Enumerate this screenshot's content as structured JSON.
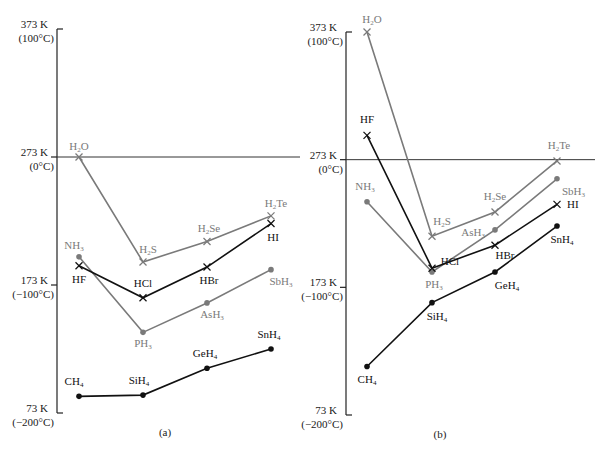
{
  "chart_data": [
    {
      "type": "line",
      "panel_label": "(a)",
      "ylabel": "Temperature",
      "ylim": [
        73,
        373
      ],
      "yticks": [
        {
          "value": 373,
          "k": "373 K",
          "c": "(100°C)"
        },
        {
          "value": 273,
          "k": "273 K",
          "c": "(0°C)"
        },
        {
          "value": 173,
          "k": "173 K",
          "c": "(−100°C)"
        },
        {
          "value": 73,
          "k": "73 K",
          "c": "(−200°C)"
        }
      ],
      "reference_line": 273,
      "x": [
        2,
        3,
        4,
        5
      ],
      "series": [
        {
          "name": "Group 16 hydrides",
          "marker": "x",
          "color": "#7a7a7a",
          "points": [
            {
              "label": "H",
              "sub": "2",
              "tail": "O",
              "value": 273
            },
            {
              "label": "H",
              "sub": "2",
              "tail": "S",
              "value": 191
            },
            {
              "label": "H",
              "sub": "2",
              "tail": "Se",
              "value": 207
            },
            {
              "label": "H",
              "sub": "2",
              "tail": "Te",
              "value": 227
            }
          ]
        },
        {
          "name": "Group 15 hydrides",
          "marker": "dot",
          "color": "#7a7a7a",
          "points": [
            {
              "label": "NH",
              "sub": "3",
              "tail": "",
              "value": 195
            },
            {
              "label": "PH",
              "sub": "3",
              "tail": "",
              "value": 136
            },
            {
              "label": "AsH",
              "sub": "3",
              "tail": "",
              "value": 159
            },
            {
              "label": "SbH",
              "sub": "3",
              "tail": "",
              "value": 185
            }
          ]
        },
        {
          "name": "Group 17 hydrides",
          "marker": "x",
          "color": "#111111",
          "points": [
            {
              "label": "HF",
              "sub": "",
              "tail": "",
              "value": 188
            },
            {
              "label": "HCl",
              "sub": "",
              "tail": "",
              "value": 163
            },
            {
              "label": "HBr",
              "sub": "",
              "tail": "",
              "value": 187
            },
            {
              "label": "HI",
              "sub": "",
              "tail": "",
              "value": 221
            }
          ]
        },
        {
          "name": "Group 14 hydrides",
          "marker": "dot",
          "color": "#111111",
          "points": [
            {
              "label": "CH",
              "sub": "4",
              "tail": "",
              "value": 86
            },
            {
              "label": "SiH",
              "sub": "4",
              "tail": "",
              "value": 87
            },
            {
              "label": "GeH",
              "sub": "4",
              "tail": "",
              "value": 108
            },
            {
              "label": "SnH",
              "sub": "4",
              "tail": "",
              "value": 123
            }
          ]
        }
      ]
    },
    {
      "type": "line",
      "panel_label": "(b)",
      "ylabel": "Temperature",
      "ylim": [
        73,
        373
      ],
      "yticks": [
        {
          "value": 373,
          "k": "373 K",
          "c": "(100°C)"
        },
        {
          "value": 273,
          "k": "273 K",
          "c": "(0°C)"
        },
        {
          "value": 173,
          "k": "173 K",
          "c": "(−100°C)"
        },
        {
          "value": 73,
          "k": "73 K",
          "c": "(−200°C)"
        }
      ],
      "reference_line": 273,
      "x": [
        2,
        3,
        4,
        5
      ],
      "series": [
        {
          "name": "Group 16 hydrides",
          "marker": "x",
          "color": "#7a7a7a",
          "points": [
            {
              "label": "H",
              "sub": "2",
              "tail": "O",
              "value": 373
            },
            {
              "label": "H",
              "sub": "2",
              "tail": "S",
              "value": 213
            },
            {
              "label": "H",
              "sub": "2",
              "tail": "Se",
              "value": 232
            },
            {
              "label": "H",
              "sub": "2",
              "tail": "Te",
              "value": 272
            }
          ]
        },
        {
          "name": "Group 15 hydrides",
          "marker": "dot",
          "color": "#7a7a7a",
          "points": [
            {
              "label": "NH",
              "sub": "3",
              "tail": "",
              "value": 240
            },
            {
              "label": "PH",
              "sub": "3",
              "tail": "",
              "value": 185
            },
            {
              "label": "AsH",
              "sub": "3",
              "tail": "",
              "value": 218
            },
            {
              "label": "SbH",
              "sub": "3",
              "tail": "",
              "value": 258
            }
          ]
        },
        {
          "name": "Group 17 hydrides",
          "marker": "x",
          "color": "#111111",
          "points": [
            {
              "label": "HF",
              "sub": "",
              "tail": "",
              "value": 292
            },
            {
              "label": "HCl",
              "sub": "",
              "tail": "",
              "value": 188
            },
            {
              "label": "HBr",
              "sub": "",
              "tail": "",
              "value": 206
            },
            {
              "label": "HI",
              "sub": "",
              "tail": "",
              "value": 238
            }
          ]
        },
        {
          "name": "Group 14 hydrides",
          "marker": "dot",
          "color": "#111111",
          "points": [
            {
              "label": "CH",
              "sub": "4",
              "tail": "",
              "value": 111
            },
            {
              "label": "SiH",
              "sub": "4",
              "tail": "",
              "value": 161
            },
            {
              "label": "GeH",
              "sub": "4",
              "tail": "",
              "value": 185
            },
            {
              "label": "SnH",
              "sub": "4",
              "tail": "",
              "value": 221
            }
          ]
        }
      ]
    }
  ]
}
